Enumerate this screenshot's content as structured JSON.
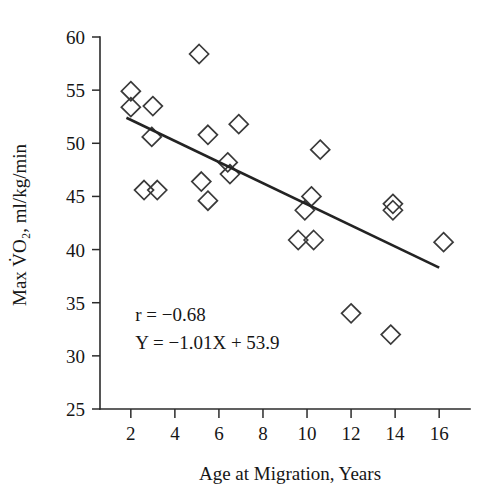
{
  "chart_data": {
    "type": "scatter",
    "title": "",
    "xlabel": "Age at Migration, Years",
    "ylabel": "Max V̇O₂, ml/kg/min",
    "xlim": [
      0.6,
      17.4
    ],
    "ylim": [
      25,
      60
    ],
    "xticks": [
      2,
      4,
      6,
      8,
      10,
      12,
      14,
      16
    ],
    "yticks": [
      25,
      30,
      35,
      40,
      45,
      50,
      55,
      60
    ],
    "xtick_labels": [
      "2",
      "4",
      "6",
      "8",
      "10",
      "12",
      "14",
      "16"
    ],
    "ytick_labels": [
      "25",
      "30",
      "35",
      "40",
      "45",
      "50",
      "55",
      "60"
    ],
    "grid": false,
    "legend": false,
    "marker": "diamond-open",
    "marker_color": "#3a3a3a",
    "line_color": "#232323",
    "points": [
      {
        "x": 2.0,
        "y": 54.9
      },
      {
        "x": 2.0,
        "y": 53.4
      },
      {
        "x": 3.0,
        "y": 53.5
      },
      {
        "x": 2.6,
        "y": 45.6
      },
      {
        "x": 3.2,
        "y": 45.6
      },
      {
        "x": 2.95,
        "y": 50.6
      },
      {
        "x": 5.1,
        "y": 58.4
      },
      {
        "x": 5.2,
        "y": 46.4
      },
      {
        "x": 5.5,
        "y": 44.6
      },
      {
        "x": 5.5,
        "y": 50.8
      },
      {
        "x": 6.4,
        "y": 48.2
      },
      {
        "x": 6.5,
        "y": 47.1
      },
      {
        "x": 6.9,
        "y": 51.8
      },
      {
        "x": 9.6,
        "y": 40.9
      },
      {
        "x": 9.9,
        "y": 43.7
      },
      {
        "x": 10.2,
        "y": 45.0
      },
      {
        "x": 10.3,
        "y": 40.9
      },
      {
        "x": 10.6,
        "y": 49.4
      },
      {
        "x": 12.0,
        "y": 34.0
      },
      {
        "x": 13.8,
        "y": 32.0
      },
      {
        "x": 13.9,
        "y": 44.3
      },
      {
        "x": 13.9,
        "y": 43.7
      },
      {
        "x": 16.2,
        "y": 40.7
      }
    ],
    "fit_line": {
      "slope": -1.01,
      "intercept": 53.9,
      "x_start": 1.8,
      "x_end": 16.0,
      "y_start": 52.4,
      "y_end": 38.3
    },
    "annotations": [
      {
        "id": "correlation",
        "text": "r = −0.68",
        "x": 2.2,
        "y": 33.3
      },
      {
        "id": "regression-equation",
        "text": "Y = −1.01X + 53.9",
        "x": 2.2,
        "y": 30.6
      }
    ]
  }
}
